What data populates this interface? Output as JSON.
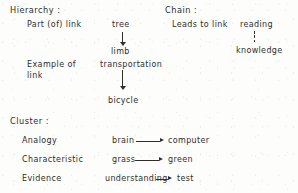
{
  "document": {
    "kind": "scanned-diagram",
    "ink_color": "#2e2e2e",
    "paper_color": "#fdfdfc"
  },
  "sections": [
    {
      "id": "hierarchy",
      "heading": "Hierarchy :",
      "link_types": [
        {
          "id": "part-of-link",
          "label": "Part (of) link"
        },
        {
          "id": "example-of-link",
          "label_line1": "Example of",
          "label_line2": "link"
        }
      ],
      "examples": [
        {
          "id": "tree-limb",
          "from": "tree",
          "to": "limb",
          "connector": "solid-down-arrow"
        },
        {
          "id": "transportation-bicycle",
          "from": "transportation",
          "to": "bicycle",
          "connector": "solid-down-arrow"
        }
      ]
    },
    {
      "id": "chain",
      "heading": "Chain :",
      "link_types": [
        {
          "id": "leads-to-link",
          "label": "Leads to link"
        }
      ],
      "examples": [
        {
          "id": "reading-knowledge",
          "from": "reading",
          "to": "knowledge",
          "connector": "dotted-down-arrow"
        }
      ]
    },
    {
      "id": "cluster",
      "heading": "Cluster :",
      "link_types": [
        {
          "id": "analogy",
          "label": "Analogy"
        },
        {
          "id": "characteristic",
          "label": "Characteristic"
        },
        {
          "id": "evidence",
          "label": "Evidence"
        }
      ],
      "examples": [
        {
          "id": "brain-computer",
          "from": "brain",
          "to": "computer",
          "connector": "solid-right-arrow"
        },
        {
          "id": "grass-green",
          "from": "grass",
          "to": "green",
          "connector": "solid-right-arrow"
        },
        {
          "id": "understanding-test",
          "from": "understanding",
          "to": "test",
          "connector": "solid-right-arrow"
        }
      ]
    }
  ]
}
